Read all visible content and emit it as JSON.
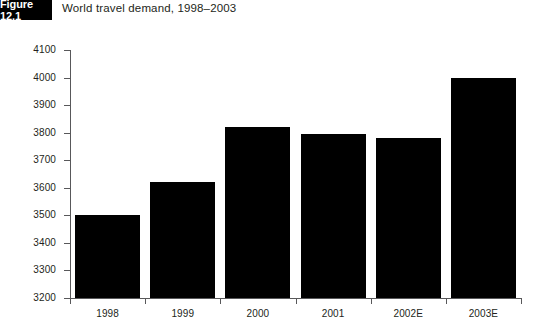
{
  "figure": {
    "badge_label": "Figure 12.1",
    "title": "World travel demand, 1998–2003"
  },
  "chart_data": {
    "type": "bar",
    "title": "World travel demand, 1998–2003",
    "xlabel": "",
    "ylabel": "",
    "categories": [
      "1998",
      "1999",
      "2000",
      "2001",
      "2002E",
      "2003E"
    ],
    "values": [
      3500,
      3620,
      3820,
      3795,
      3780,
      4000
    ],
    "ylim": [
      3200,
      4100
    ],
    "ytick_step": 100,
    "yticks": [
      "4100",
      "4000",
      "3900",
      "3800",
      "3700",
      "3600",
      "3500",
      "3400",
      "3300",
      "3200"
    ],
    "ytick_values": [
      4100,
      4000,
      3900,
      3800,
      3700,
      3600,
      3500,
      3400,
      3300,
      3200
    ],
    "grid": false,
    "legend": null,
    "bar_color": "#000000",
    "axis_color": "#58585a",
    "background": "#ffffff"
  }
}
